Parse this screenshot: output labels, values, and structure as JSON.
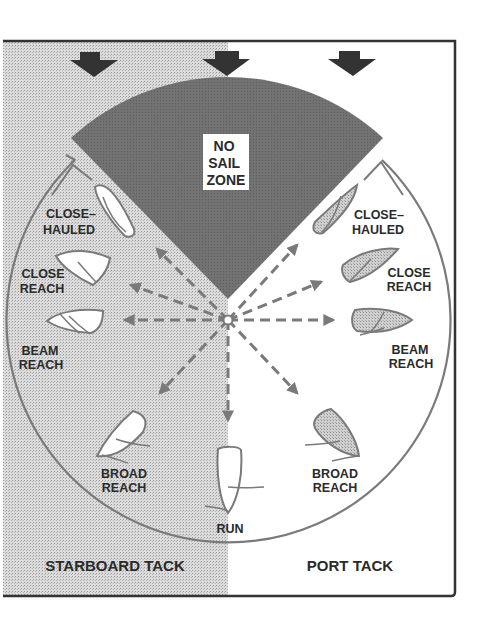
{
  "figure": {
    "wind_arrows": 3,
    "no_sail_zone": {
      "line1": "NO",
      "line2": "SAIL",
      "line3": "ZONE"
    },
    "tacks": {
      "left": "STARBOARD TACK",
      "right": "PORT TACK"
    },
    "points_of_sail": {
      "starboard": {
        "close_hauled": {
          "line1": "CLOSE–",
          "line2": "HAULED"
        },
        "close_reach": {
          "line1": "CLOSE",
          "line2": "REACH"
        },
        "beam_reach": {
          "line1": "BEAM",
          "line2": "REACH"
        },
        "broad_reach": {
          "line1": "BROAD",
          "line2": "REACH"
        }
      },
      "run": "RUN",
      "port": {
        "close_hauled": {
          "line1": "CLOSE–",
          "line2": "HAULED"
        },
        "close_reach": {
          "line1": "CLOSE",
          "line2": "REACH"
        },
        "beam_reach": {
          "line1": "BEAM",
          "line2": "REACH"
        },
        "broad_reach": {
          "line1": "BROAD",
          "line2": "REACH"
        }
      }
    },
    "colors": {
      "stipple": "#cfcfcf",
      "no_sail_zone": "#6e6e6e",
      "arrow_dark": "#333333",
      "line": "#7a7a7a",
      "frame": "#333333",
      "boat_port_fill": "#c4c4c4"
    }
  }
}
